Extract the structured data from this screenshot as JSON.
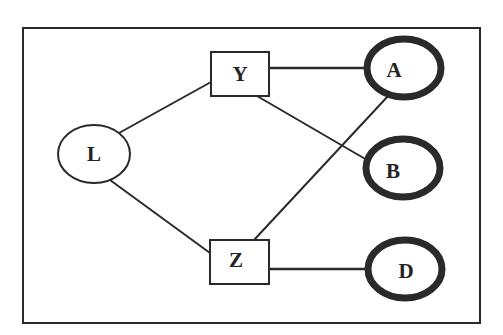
{
  "diagram": {
    "type": "graph",
    "frame": {
      "x": 23,
      "y": 28,
      "width": 457,
      "height": 295
    },
    "colors": {
      "stroke": "#2a2a2a",
      "background": "#ffffff",
      "text": "#222222"
    },
    "nodes": [
      {
        "id": "L",
        "label": "L",
        "shape": "ellipse",
        "cx": 94,
        "cy": 154,
        "rx": 36,
        "ry": 29,
        "emphasis": false
      },
      {
        "id": "Y",
        "label": "Y",
        "shape": "rect",
        "x": 211,
        "y": 52,
        "w": 58,
        "h": 44,
        "emphasis": false
      },
      {
        "id": "Z",
        "label": "Z",
        "shape": "rect",
        "x": 210,
        "y": 240,
        "w": 59,
        "h": 44,
        "emphasis": false
      },
      {
        "id": "A",
        "label": "A",
        "shape": "ellipse",
        "cx": 404,
        "cy": 68,
        "rx": 37,
        "ry": 29,
        "emphasis": true
      },
      {
        "id": "B",
        "label": "B",
        "shape": "ellipse",
        "cx": 403,
        "cy": 168,
        "rx": 37,
        "ry": 29,
        "emphasis": true
      },
      {
        "id": "D",
        "label": "D",
        "shape": "ellipse",
        "cx": 405,
        "cy": 269,
        "rx": 37,
        "ry": 29,
        "emphasis": true
      }
    ],
    "edges": [
      {
        "from": "L",
        "to": "Y"
      },
      {
        "from": "L",
        "to": "Z"
      },
      {
        "from": "Y",
        "to": "A"
      },
      {
        "from": "Y",
        "to": "B"
      },
      {
        "from": "Z",
        "to": "A"
      },
      {
        "from": "Z",
        "to": "D"
      }
    ]
  }
}
